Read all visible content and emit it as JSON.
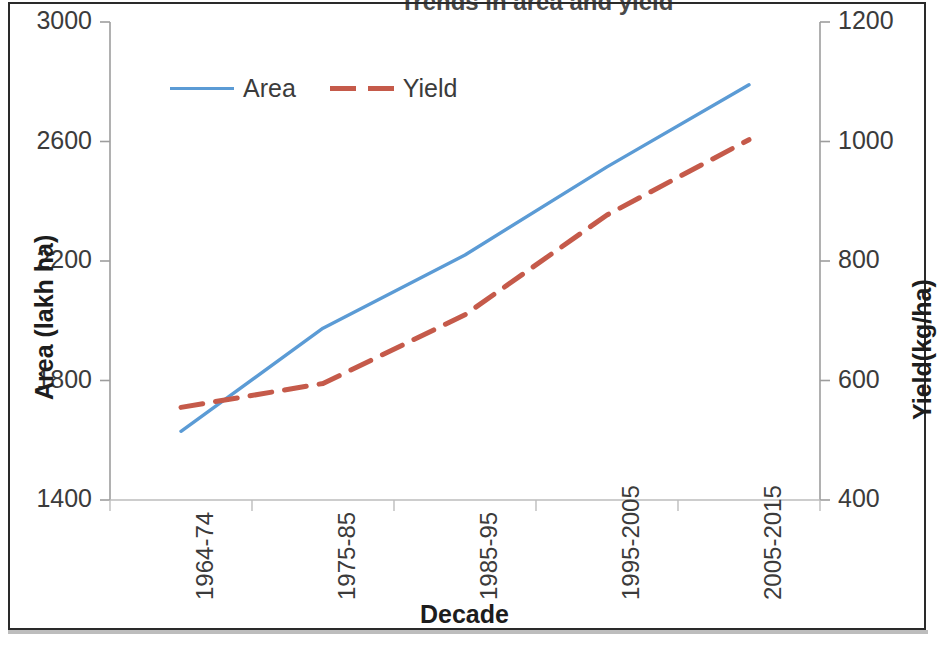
{
  "chart_data": {
    "type": "line",
    "title": "Trends in area and yield",
    "xlabel": "Decade",
    "ylabel": "Area (lakh  ha)",
    "y2label": "Yield(kg/ha)",
    "categories": [
      "1964-74",
      "1975-85",
      "1985-95",
      "1995-2005",
      "2005-2015"
    ],
    "series": [
      {
        "name": "Area",
        "axis": "left",
        "color": "#5B9BD5",
        "style": "solid",
        "values": [
          1630,
          1975,
          2220,
          2515,
          2790
        ]
      },
      {
        "name": "Yield",
        "axis": "right",
        "color": "#C55A4A",
        "style": "dashed",
        "values": [
          555,
          595,
          710,
          877,
          1003
        ]
      }
    ],
    "ylim": [
      1400,
      3000
    ],
    "yticks": [
      "1400",
      "1800",
      "2200",
      "2600",
      "3000"
    ],
    "ytick_values": [
      1400,
      1800,
      2200,
      2600,
      3000
    ],
    "y2lim": [
      400,
      1200
    ],
    "y2ticks": [
      "400",
      "600",
      "800",
      "1000",
      "1200"
    ],
    "y2tick_values": [
      400,
      600,
      800,
      1000,
      1200
    ],
    "grid": false,
    "legend_position": "upper-left-inside"
  },
  "legend": {
    "items": [
      {
        "label": "Area"
      },
      {
        "label": "Yield"
      }
    ]
  }
}
